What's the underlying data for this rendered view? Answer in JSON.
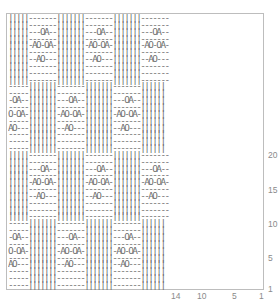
{
  "chart": {
    "title": "",
    "symbols": {
      "knit": "|",
      "purl": "-",
      "yarn_over": "O",
      "k2tog": "A",
      "ssk": "A"
    },
    "block_rows": [
      "|||||-------|||||||-------|||||||-------",
      "|||||-------|||||||-------|||||||-------",
      "|||||---OA--|||||||---OA--|||||||---OA--",
      "|||||-------|||||||-------|||||||-------",
      "|||||-AO-OA-|||||||-AO-OA-|||||||-AO-OA-",
      "|||||-------|||||||-------|||||||-------",
      "|||||--AO---|||||||--AO---|||||||--AO---",
      "|||||-------|||||||-------|||||||-------",
      "|||||-------|||||||-------|||||||-------",
      "|||||-------|||||||-------|||||||-------"
    ],
    "alt_rows": [
      "-----|||||||-------|||||||-------||||||",
      "-----|||||||-------|||||||-------||||||",
      "-OA--|||||||---OA--|||||||---OA--||||||",
      "-----|||||||-------|||||||-------||||||",
      "O-OA-|||||||-AO-OA-|||||||-AO-OA-||||||",
      "-----|||||||-------|||||||-------||||||",
      "AO---|||||||--AO---|||||||--AO---||||||",
      "-----|||||||-------|||||||-------||||||",
      "-----|||||||-------|||||||-------||||||",
      "-----|||||||-------|||||||-------||||||"
    ],
    "row_labels": [
      {
        "text": "20",
        "top": 150
      },
      {
        "text": "15",
        "top": 185
      },
      {
        "text": "10",
        "top": 219
      },
      {
        "text": "5",
        "top": 253
      },
      {
        "text": "1",
        "top": 284
      }
    ],
    "col_labels": [
      {
        "text": "14",
        "left": 171
      },
      {
        "text": "10",
        "left": 197
      },
      {
        "text": "5",
        "left": 232
      },
      {
        "text": "1",
        "left": 259
      }
    ]
  }
}
